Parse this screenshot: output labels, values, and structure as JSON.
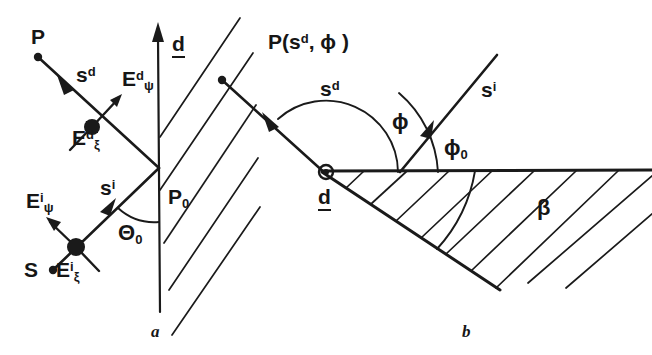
{
  "figure": {
    "background_color": "#ffffff",
    "ink_color": "#1a1a1a",
    "panels": [
      {
        "id": "a",
        "caption": "a",
        "description": "Half-plane / screen with incident ray from source S through P0 and diffracted ray to observation point P, showing field components."
      },
      {
        "id": "b",
        "caption": "b",
        "description": "Wedge of exterior angle with incident direction s-i and diffraction direction s-d measured by angles phi and phi-0 from the wedge face."
      }
    ]
  },
  "panel_a": {
    "caption": "a",
    "labels": {
      "observation_point": "P",
      "source_point": "S",
      "diffraction_point_base": "P",
      "diffraction_point_sub": "0",
      "ray_diffracted_base": "s",
      "ray_diffracted_sup": "d",
      "ray_incident_base": "s",
      "ray_incident_sup": "i",
      "axis_normal": "d",
      "field_d_psi_base": "E",
      "field_d_psi_sup": "d",
      "field_d_psi_sub": "ψ",
      "field_d_xi_base": "E",
      "field_d_xi_sup": "d",
      "field_d_xi_sub": "ξ",
      "field_i_psi_base": "E",
      "field_i_psi_sup": "i",
      "field_i_psi_sub": "ψ",
      "field_i_xi_base": "E",
      "field_i_xi_sup": "i",
      "field_i_xi_sub": "ξ",
      "angle_theta_base": "Θ",
      "angle_theta_sub": "0"
    }
  },
  "panel_b": {
    "caption": "b",
    "labels": {
      "observation_point_base": "P(s",
      "observation_point_sup": "d",
      "observation_point_tail": ", ϕ )",
      "ray_diffracted_base": "s",
      "ray_diffracted_sup": "d",
      "ray_incident_base": "s",
      "ray_incident_sup": "i",
      "angle_phi": "ϕ",
      "angle_phi0_base": "ϕ",
      "angle_phi0_sub": "0",
      "angle_beta": "β",
      "edge_vector": "d"
    }
  }
}
